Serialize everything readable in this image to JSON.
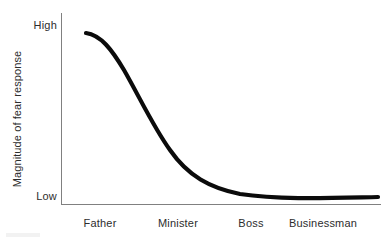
{
  "figure": {
    "background_color": "#ffffff",
    "axis_color": "#808080",
    "curve_color": "#0b0b0b",
    "text_color": "#2d2d2d"
  },
  "axes": {
    "y_title": "Magnitude of fear response",
    "y_high_label": "High",
    "y_low_label": "Low"
  },
  "categories": [
    {
      "label": "Father",
      "center_x": 100
    },
    {
      "label": "Minister",
      "center_x": 178
    },
    {
      "label": "Boss",
      "center_x": 251
    },
    {
      "label": "Businessman",
      "center_x": 323
    }
  ],
  "chart_data": {
    "type": "line",
    "title": "",
    "subtitle": "",
    "xlabel": "",
    "ylabel": "Magnitude of fear response",
    "categories": [
      "Father",
      "Minister",
      "Boss",
      "Businessman"
    ],
    "x": [
      0,
      1,
      2,
      3
    ],
    "values": [
      0.97,
      0.62,
      0.18,
      0.05
    ],
    "series": [
      {
        "name": "Fear response",
        "values": [
          0.97,
          0.62,
          0.18,
          0.05
        ]
      }
    ],
    "y_tick_labels": [
      "Low",
      "High"
    ],
    "x_tick_labels": [
      "Father",
      "Minister",
      "Boss",
      "Businessman"
    ],
    "ylim": [
      0,
      1
    ],
    "xlim": [
      -0.2,
      3.4
    ],
    "grid": false,
    "legend": "none",
    "annotations": [],
    "curve_path": "M 86,33 C 101,35 112,50 124,70 C 140,98 154,128 170,150 C 188,176 210,188 240,194 C 280,200 330,198 378,197",
    "line_width_px": 4.2,
    "smoothing": "monotone-decreasing-sigmoid"
  }
}
